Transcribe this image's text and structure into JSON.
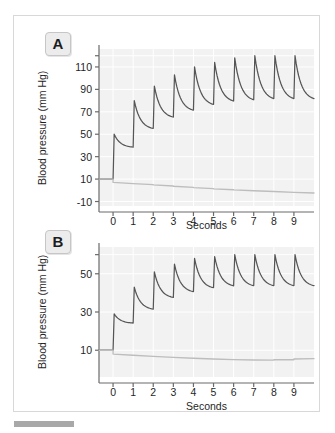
{
  "figure": {
    "panels": [
      {
        "id": "A",
        "label": "A",
        "ylabel": "Blood pressure (mm Hg)",
        "xlabel": "Seconds"
      },
      {
        "id": "B",
        "label": "B",
        "ylabel": "Blood pressure (mm Hg)",
        "xlabel": "Seconds"
      }
    ]
  },
  "chart_data": [
    {
      "type": "line",
      "panel": "A",
      "title": "",
      "xlabel": "Seconds",
      "ylabel": "Blood pressure (mm Hg)",
      "xlim": [
        -0.7,
        10.0
      ],
      "ylim": [
        -14,
        126
      ],
      "xticks": [
        0,
        1,
        2,
        3,
        4,
        5,
        6,
        7,
        8,
        9
      ],
      "xticklabels": [
        "0",
        "1",
        "2",
        "3",
        "4",
        "5",
        "6",
        "7",
        "8",
        "9"
      ],
      "yticks": [
        -10,
        10,
        30,
        50,
        70,
        90,
        110,
        120
      ],
      "yticklabels": [
        "-10",
        "10",
        "30",
        "50",
        "70",
        "90",
        "110",
        ""
      ],
      "grid": true,
      "series": [
        {
          "name": "arterial-pressure",
          "color": "#555555",
          "baseline": 10,
          "beat_period": 1.0,
          "beats": [
            {
              "t": 0.0,
              "peak": 50,
              "trough": 38
            },
            {
              "t": 1.0,
              "peak": 80,
              "trough": 54
            },
            {
              "t": 2.0,
              "peak": 93,
              "trough": 64
            },
            {
              "t": 3.0,
              "peak": 103,
              "trough": 70
            },
            {
              "t": 4.0,
              "peak": 110,
              "trough": 75
            },
            {
              "t": 5.0,
              "peak": 114,
              "trough": 78
            },
            {
              "t": 6.0,
              "peak": 118,
              "trough": 79
            },
            {
              "t": 7.0,
              "peak": 120,
              "trough": 80
            },
            {
              "t": 8.0,
              "peak": 120,
              "trough": 80
            },
            {
              "t": 9.0,
              "peak": 120,
              "trough": 80
            }
          ]
        },
        {
          "name": "venous-pressure",
          "color": "#bdbdbd",
          "baseline": 10,
          "beat_period": 1.0,
          "beats": [
            {
              "t": 0.0,
              "step": 7.0,
              "end": 6.0
            },
            {
              "t": 1.0,
              "step": 6.0,
              "end": 5.0
            },
            {
              "t": 2.0,
              "step": 4.8,
              "end": 3.8
            },
            {
              "t": 3.0,
              "step": 3.6,
              "end": 2.6
            },
            {
              "t": 4.0,
              "step": 2.4,
              "end": 1.5
            },
            {
              "t": 5.0,
              "step": 1.3,
              "end": 0.5
            },
            {
              "t": 6.0,
              "step": 0.4,
              "end": -0.4
            },
            {
              "t": 7.0,
              "step": -0.4,
              "end": -1.1
            },
            {
              "t": 8.0,
              "step": -1.1,
              "end": -1.8
            },
            {
              "t": 9.0,
              "step": -1.8,
              "end": -2.4
            }
          ]
        }
      ]
    },
    {
      "type": "line",
      "panel": "B",
      "title": "",
      "xlabel": "Seconds",
      "ylabel": "Blood pressure (mm Hg)",
      "xlim": [
        -0.7,
        10.0
      ],
      "ylim": [
        -4,
        64
      ],
      "xticks": [
        0,
        1,
        2,
        3,
        4,
        5,
        6,
        7,
        8,
        9
      ],
      "xticklabels": [
        "0",
        "1",
        "2",
        "3",
        "4",
        "5",
        "6",
        "7",
        "8",
        "9"
      ],
      "yticks": [
        10,
        30,
        50,
        60
      ],
      "yticklabels": [
        "10",
        "30",
        "50",
        ""
      ],
      "grid": true,
      "series": [
        {
          "name": "arterial-pressure",
          "color": "#555555",
          "baseline": 10,
          "beat_period": 1.0,
          "beats": [
            {
              "t": 0.0,
              "peak": 29,
              "trough": 24
            },
            {
              "t": 1.0,
              "peak": 43,
              "trough": 31
            },
            {
              "t": 2.0,
              "peak": 51,
              "trough": 37
            },
            {
              "t": 3.0,
              "peak": 55,
              "trough": 40
            },
            {
              "t": 4.0,
              "peak": 58,
              "trough": 42
            },
            {
              "t": 5.0,
              "peak": 59,
              "trough": 43
            },
            {
              "t": 6.0,
              "peak": 60,
              "trough": 43
            },
            {
              "t": 7.0,
              "peak": 60,
              "trough": 43
            },
            {
              "t": 8.0,
              "peak": 60,
              "trough": 43
            },
            {
              "t": 9.0,
              "peak": 60,
              "trough": 43
            }
          ]
        },
        {
          "name": "venous-pressure",
          "color": "#bdbdbd",
          "baseline": 10,
          "beat_period": 1.0,
          "beats": [
            {
              "t": 0.0,
              "step": 8.0,
              "end": 7.4
            },
            {
              "t": 1.0,
              "step": 7.4,
              "end": 6.8
            },
            {
              "t": 2.0,
              "step": 6.8,
              "end": 6.3
            },
            {
              "t": 3.0,
              "step": 6.3,
              "end": 5.8
            },
            {
              "t": 4.0,
              "step": 5.8,
              "end": 5.4
            },
            {
              "t": 5.0,
              "step": 5.4,
              "end": 5.1
            },
            {
              "t": 6.0,
              "step": 5.1,
              "end": 4.9
            },
            {
              "t": 7.0,
              "step": 4.9,
              "end": 4.8
            },
            {
              "t": 8.0,
              "step": 5.0,
              "end": 5.0
            },
            {
              "t": 9.0,
              "step": 5.4,
              "end": 5.6
            }
          ]
        }
      ]
    }
  ]
}
